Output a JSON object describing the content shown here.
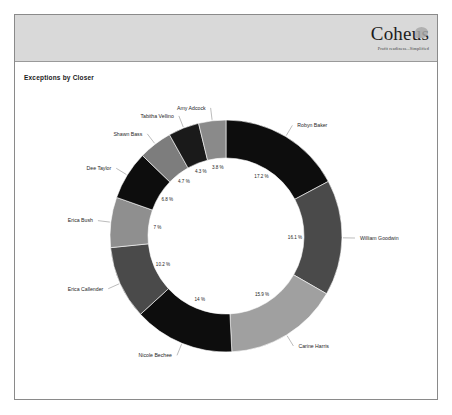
{
  "header": {
    "logo_wordmark": "Coheus",
    "logo_tagline": "Profit readiness...Simplified"
  },
  "report": {
    "title": "Exceptions by Closer"
  },
  "chart_data": {
    "type": "pie",
    "variant": "donut",
    "title": "Exceptions by Closer",
    "xlabel": "",
    "ylabel": "",
    "legend_position": "none",
    "labels_outside": true,
    "value_suffix": "%",
    "categories": [
      "Robyn Baker",
      "William Goodwin",
      "Carine Harris",
      "Nicole Bechee",
      "Erica Callender",
      "Erica Bush",
      "Dee Taylor",
      "Shawn Bass",
      "Tabitha Vellino",
      "Amy Adcock"
    ],
    "values": [
      17.2,
      16.1,
      15.9,
      14.0,
      10.2,
      7.0,
      6.8,
      4.7,
      4.3,
      3.8
    ],
    "value_labels": [
      "17.2 %",
      "16.1 %",
      "15.9 %",
      "14 %",
      "10.2 %",
      "7 %",
      "6.8 %",
      "4.7 %",
      "4.3 %",
      "3.8 %"
    ],
    "colors": [
      "#0d0d0d",
      "#4a4a4a",
      "#a0a0a0",
      "#0d0d0d",
      "#4a4a4a",
      "#8f8f8f",
      "#0d0d0d",
      "#7d7d7d",
      "#1a1a1a",
      "#8a8a8a"
    ]
  }
}
